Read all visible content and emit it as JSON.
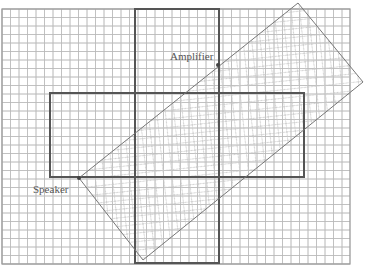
{
  "diagram": {
    "labels": {
      "amplifier": "Amplifier",
      "speaker": "Speaker"
    },
    "grid": {
      "x0": 2,
      "y0": 9,
      "x1": 350,
      "y1": 264,
      "cell": 8.5,
      "color": "#b8b8b8"
    },
    "cross": {
      "vertical_bar": {
        "x": 135,
        "y": 9,
        "width": 84,
        "height": 254
      },
      "horizontal_bar": {
        "x": 50,
        "y": 93,
        "width": 254,
        "height": 84
      },
      "stroke": "#555555"
    },
    "rotated_rectangle": {
      "points": [
        [
          79,
          178
        ],
        [
          298,
          3
        ],
        [
          363,
          82
        ],
        [
          143,
          260
        ]
      ],
      "stroke": "#777777",
      "hatch": "#cfcfcf"
    },
    "points": {
      "amplifier": [
        218,
        65
      ],
      "speaker": [
        79,
        178
      ]
    }
  }
}
